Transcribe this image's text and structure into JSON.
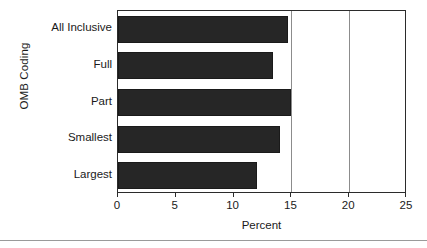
{
  "chart_data": {
    "type": "bar",
    "orientation": "horizontal",
    "title": "",
    "xlabel": "Percent",
    "ylabel": "OMB Coding",
    "categories": [
      "All Inclusive",
      "Full",
      "Part",
      "Smallest",
      "Largest"
    ],
    "values": [
      14.7,
      13.4,
      15.0,
      14.0,
      12.0
    ],
    "xlim": [
      0,
      25
    ],
    "xticks": [
      0,
      5,
      10,
      15,
      20,
      25
    ],
    "xtick_labels": [
      "0",
      "5",
      "10",
      "15",
      "20",
      "25"
    ],
    "gridlines_x": [
      15,
      20
    ],
    "grid": "vertical-partial",
    "legend": null,
    "bar_color": "#262626",
    "background_color": "#ffffff",
    "axis_color": "#2b2b2b",
    "gridline_color": "#8c8c8c"
  }
}
